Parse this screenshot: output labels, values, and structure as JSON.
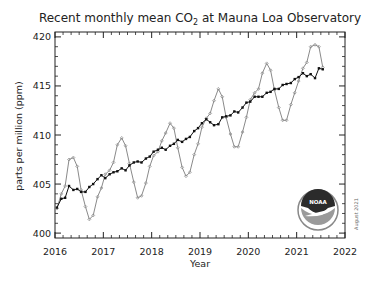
{
  "chart_data": {
    "type": "line",
    "title": "Recent monthly mean CO2 at Mauna Loa Observatory",
    "title_parts": {
      "pre": "Recent monthly mean CO",
      "sub": "2",
      "post": " at Mauna Loa Observatory"
    },
    "xlabel": "Year",
    "ylabel": "parts per million (ppm)",
    "xlim": [
      2016,
      2022
    ],
    "ylim": [
      399.5,
      420.5
    ],
    "xticks": [
      2016,
      2017,
      2018,
      2019,
      2020,
      2021,
      2022
    ],
    "yticks": [
      400,
      405,
      410,
      415,
      420
    ],
    "annotation": "August 2021",
    "logo": "NOAA",
    "grid": false,
    "series": [
      {
        "name": "Monthly mean",
        "style": "gray line with small diamond markers",
        "color": "#8a8a8a",
        "x": [
          2016.04,
          2016.13,
          2016.21,
          2016.29,
          2016.38,
          2016.46,
          2016.54,
          2016.63,
          2016.71,
          2016.79,
          2016.88,
          2016.96,
          2017.04,
          2017.13,
          2017.21,
          2017.29,
          2017.38,
          2017.46,
          2017.54,
          2017.63,
          2017.71,
          2017.79,
          2017.88,
          2017.96,
          2018.04,
          2018.13,
          2018.21,
          2018.29,
          2018.38,
          2018.46,
          2018.54,
          2018.63,
          2018.71,
          2018.79,
          2018.88,
          2018.96,
          2019.04,
          2019.13,
          2019.21,
          2019.29,
          2019.38,
          2019.46,
          2019.54,
          2019.63,
          2019.71,
          2019.79,
          2019.88,
          2019.96,
          2020.04,
          2020.13,
          2020.21,
          2020.29,
          2020.38,
          2020.46,
          2020.54,
          2020.63,
          2020.71,
          2020.79,
          2020.88,
          2020.96,
          2021.04,
          2021.13,
          2021.21,
          2021.29,
          2021.38,
          2021.46,
          2021.54
        ],
        "values": [
          402.5,
          404.0,
          404.8,
          407.5,
          407.7,
          406.8,
          404.4,
          402.7,
          401.4,
          401.8,
          403.7,
          404.6,
          406.0,
          406.4,
          407.2,
          409.0,
          409.7,
          408.9,
          407.1,
          405.2,
          403.6,
          403.8,
          405.1,
          406.8,
          407.9,
          408.3,
          409.4,
          410.2,
          411.2,
          410.7,
          408.7,
          406.7,
          405.8,
          406.2,
          408.0,
          409.1,
          410.8,
          411.7,
          412.2,
          413.5,
          414.7,
          413.9,
          411.8,
          410.1,
          408.8,
          408.8,
          410.3,
          411.8,
          413.6,
          414.3,
          414.7,
          416.3,
          417.3,
          416.6,
          414.6,
          412.8,
          411.5,
          411.5,
          413.1,
          414.3,
          415.5,
          416.8,
          417.4,
          419.0,
          419.2,
          419.0,
          416.9
        ]
      },
      {
        "name": "Seasonally corrected",
        "style": "black line with small square markers",
        "color": "#111111",
        "x": [
          2016.04,
          2016.13,
          2016.21,
          2016.29,
          2016.38,
          2016.46,
          2016.54,
          2016.63,
          2016.71,
          2016.79,
          2016.88,
          2016.96,
          2017.04,
          2017.13,
          2017.21,
          2017.29,
          2017.38,
          2017.46,
          2017.54,
          2017.63,
          2017.71,
          2017.79,
          2017.88,
          2017.96,
          2018.04,
          2018.13,
          2018.21,
          2018.29,
          2018.38,
          2018.46,
          2018.54,
          2018.63,
          2018.71,
          2018.79,
          2018.88,
          2018.96,
          2019.04,
          2019.13,
          2019.21,
          2019.29,
          2019.38,
          2019.46,
          2019.54,
          2019.63,
          2019.71,
          2019.79,
          2019.88,
          2019.96,
          2020.04,
          2020.13,
          2020.21,
          2020.29,
          2020.38,
          2020.46,
          2020.54,
          2020.63,
          2020.71,
          2020.79,
          2020.88,
          2020.96,
          2021.04,
          2021.13,
          2021.21,
          2021.29,
          2021.38,
          2021.46,
          2021.54
        ],
        "values": [
          402.6,
          403.5,
          403.6,
          404.8,
          404.4,
          404.5,
          404.2,
          404.2,
          404.7,
          405.0,
          405.5,
          405.9,
          405.6,
          406.0,
          406.2,
          406.3,
          406.6,
          406.4,
          406.9,
          407.2,
          407.3,
          407.2,
          407.6,
          407.8,
          408.3,
          408.5,
          408.7,
          408.5,
          408.9,
          409.1,
          409.5,
          409.3,
          409.6,
          409.8,
          410.4,
          410.7,
          411.2,
          411.6,
          411.3,
          411.0,
          411.1,
          411.8,
          411.9,
          412.0,
          412.4,
          412.3,
          412.8,
          413.3,
          413.4,
          413.9,
          413.9,
          413.9,
          414.3,
          414.4,
          414.7,
          414.7,
          415.1,
          415.2,
          415.3,
          415.7,
          415.9,
          416.3,
          416.0,
          416.2,
          415.8,
          416.8,
          416.7
        ]
      }
    ]
  },
  "colors": {
    "axis": "#222222",
    "monthly": "#8a8a8a",
    "trend": "#111111",
    "logo_dark": "#2b2b2b",
    "logo_light": "#9a9a9a"
  }
}
